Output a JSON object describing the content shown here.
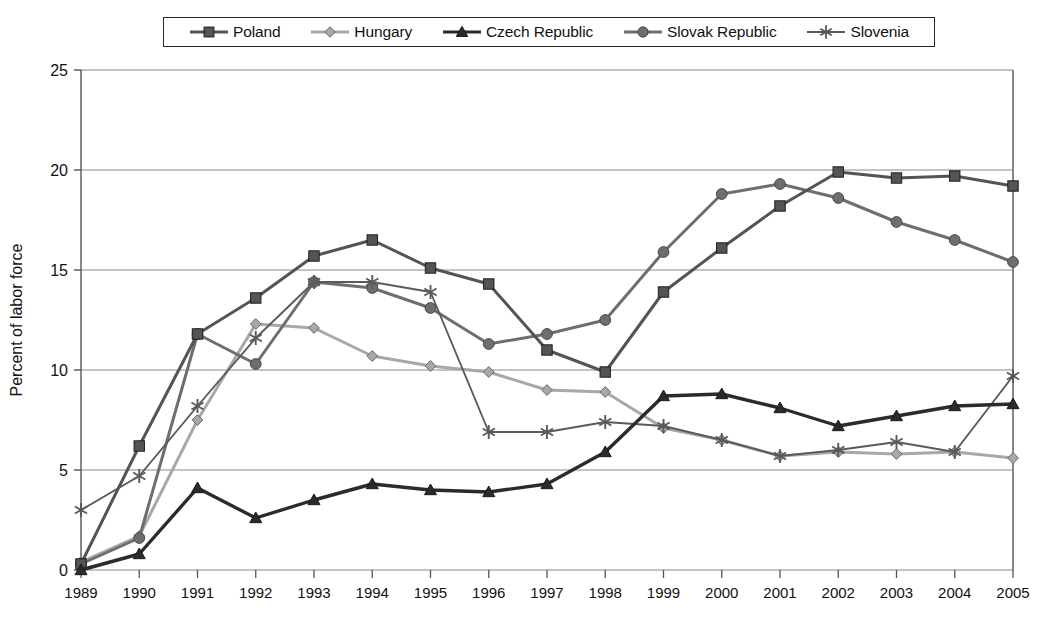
{
  "chart_data": {
    "type": "line",
    "title": "",
    "subtitle": "",
    "xlabel": "",
    "ylabel": "Percent of labor force",
    "xlim": [
      1989,
      2005
    ],
    "ylim": [
      0,
      25
    ],
    "yticks": [
      0,
      5,
      10,
      15,
      20,
      25
    ],
    "grid": "horizontal",
    "legend_position": "top-center",
    "x": [
      1989,
      1990,
      1991,
      1992,
      1993,
      1994,
      1995,
      1996,
      1997,
      1998,
      1999,
      2000,
      2001,
      2002,
      2003,
      2004,
      2005
    ],
    "categories": [
      "1989",
      "1990",
      "1991",
      "1992",
      "1993",
      "1994",
      "1995",
      "1996",
      "1997",
      "1998",
      "1999",
      "2000",
      "2001",
      "2002",
      "2003",
      "2004",
      "2005"
    ],
    "series": [
      {
        "name": "Poland",
        "marker": "square",
        "color": "#545454",
        "values": [
          0.3,
          6.2,
          11.8,
          13.6,
          15.7,
          16.5,
          15.1,
          14.3,
          11.0,
          9.9,
          13.9,
          16.1,
          18.2,
          19.9,
          19.6,
          19.7,
          19.2
        ]
      },
      {
        "name": "Hungary",
        "marker": "diamond",
        "color": "#a8a8a8",
        "values": [
          0.4,
          1.7,
          7.5,
          12.3,
          12.1,
          10.7,
          10.2,
          9.9,
          9.0,
          8.9,
          7.1,
          6.5,
          5.7,
          5.9,
          5.8,
          5.9,
          5.6
        ]
      },
      {
        "name": "Czech Republic",
        "marker": "triangle",
        "color": "#2b2b2b",
        "values": [
          0.0,
          0.8,
          4.1,
          2.6,
          3.5,
          4.3,
          4.0,
          3.9,
          4.3,
          5.9,
          8.7,
          8.8,
          8.1,
          7.2,
          7.7,
          8.2,
          8.3
        ]
      },
      {
        "name": "Slovak Republic",
        "marker": "circle",
        "color": "#6e6e6e",
        "values": [
          0.3,
          1.6,
          11.8,
          10.3,
          14.4,
          14.1,
          13.1,
          11.3,
          11.8,
          12.5,
          15.9,
          18.8,
          19.3,
          18.6,
          17.4,
          16.5,
          15.4
        ]
      },
      {
        "name": "Slovenia",
        "marker": "asterisk",
        "color": "#5a5a5a",
        "values": [
          3.0,
          4.7,
          8.2,
          11.6,
          14.4,
          14.4,
          13.9,
          6.9,
          6.9,
          7.4,
          7.2,
          6.5,
          5.7,
          6.0,
          6.4,
          5.9,
          9.7
        ]
      }
    ]
  },
  "legend": {
    "items": [
      {
        "label": "Poland",
        "marker": "square",
        "color": "#545454"
      },
      {
        "label": "Hungary",
        "marker": "diamond",
        "color": "#a8a8a8"
      },
      {
        "label": "Czech Republic",
        "marker": "triangle",
        "color": "#2b2b2b"
      },
      {
        "label": "Slovak Republic",
        "marker": "circle",
        "color": "#6e6e6e"
      },
      {
        "label": "Slovenia",
        "marker": "asterisk",
        "color": "#5a5a5a"
      }
    ]
  },
  "axes": {
    "y_axis_title": "Percent of labor force",
    "y_tick_labels": [
      "0",
      "5",
      "10",
      "15",
      "20",
      "25"
    ],
    "x_tick_labels": [
      "1989",
      "1990",
      "1991",
      "1992",
      "1993",
      "1994",
      "1995",
      "1996",
      "1997",
      "1998",
      "1999",
      "2000",
      "2001",
      "2002",
      "2003",
      "2004",
      "2005"
    ]
  },
  "style": {
    "grid_color": "#888888",
    "axis_color": "#555555",
    "background": "#ffffff"
  }
}
